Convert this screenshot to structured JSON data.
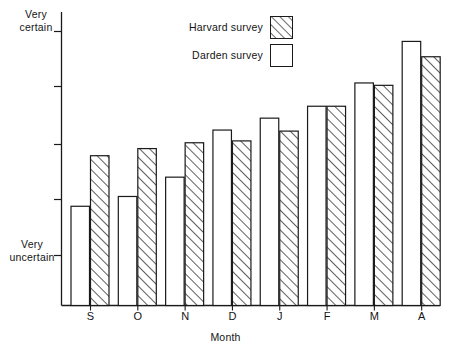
{
  "chart_data": {
    "type": "bar",
    "title": "",
    "subtitle": "",
    "xlabel": "Month",
    "ylabel": "",
    "categories": [
      "S",
      "O",
      "N",
      "D",
      "J",
      "F",
      "M",
      "A"
    ],
    "series": [
      {
        "name": "Darden survey",
        "style": "open",
        "values": [
          0.375,
          0.412,
          0.485,
          0.663,
          0.708,
          0.753,
          0.841,
          0.998
        ]
      },
      {
        "name": "Harvard survey",
        "style": "hatched",
        "values": [
          0.566,
          0.593,
          0.615,
          0.622,
          0.659,
          0.753,
          0.832,
          0.94
        ]
      }
    ],
    "ylim": [
      0,
      1.06
    ],
    "y_axis_low_label": "Very\nuncertain",
    "y_axis_high_label": "Very\ncertain",
    "y_tick_positions": [
      1.033,
      0.787,
      0.528,
      0.282,
      0.031
    ],
    "grid": false,
    "legend_position": "top-center"
  },
  "axis": {
    "y_top_label_line1": "Very",
    "y_top_label_line2": "certain",
    "y_bottom_label_line1": "Very",
    "y_bottom_label_line2": "uncertain",
    "x_title": "Month",
    "x_tick_labels": [
      "S",
      "O",
      "N",
      "D",
      "J",
      "F",
      "M",
      "A"
    ]
  },
  "legend": {
    "entries": [
      {
        "label": "Harvard survey",
        "swatch": "hatched-swatch"
      },
      {
        "label": "Darden survey",
        "swatch": "open-swatch"
      }
    ]
  },
  "colors": {
    "ink": "#1a1a1a",
    "background": "#ffffff",
    "hatch": "#2b2b2b",
    "bar_fill": "#ffffff"
  }
}
